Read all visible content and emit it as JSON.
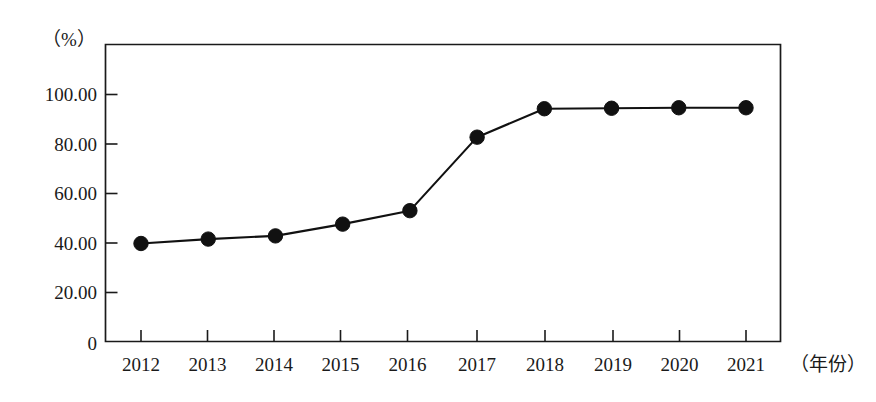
{
  "chart_data": {
    "type": "line",
    "title": "",
    "subtitle": "",
    "xlabel": "（年份）",
    "ylabel": "（%）",
    "categories": [
      "2012",
      "2013",
      "2014",
      "2015",
      "2016",
      "2017",
      "2018",
      "2019",
      "2020",
      "2021"
    ],
    "x": [
      2012,
      2013,
      2014,
      2015,
      2016,
      2017,
      2018,
      2019,
      2020,
      2021
    ],
    "values": [
      39.8,
      41.6,
      42.9,
      47.7,
      53.2,
      83.2,
      94.8,
      95.0,
      95.2,
      95.2
    ],
    "series": [
      {
        "name": "",
        "values": [
          39.8,
          41.6,
          42.9,
          47.7,
          53.2,
          83.2,
          94.8,
          95.0,
          95.2,
          95.2
        ]
      }
    ],
    "ylim": [
      0,
      120
    ],
    "xlim": [
      2011.45,
      2021.55
    ],
    "ytick_labels": [
      "0",
      "20.00",
      "40.00",
      "60.00",
      "80.00",
      "100.00"
    ],
    "ytick_values": [
      0,
      20,
      40,
      60,
      80,
      100
    ],
    "xtick_labels": [
      "2012",
      "2013",
      "2014",
      "2015",
      "2016",
      "2017",
      "2018",
      "2019",
      "2020",
      "2021"
    ],
    "grid": false,
    "legend": false,
    "legend_position": "none",
    "marker": "filled-circle",
    "line_color": "#111111",
    "marker_color": "#111111",
    "axis_color": "#1a1a1a",
    "background_color": "#ffffff",
    "annotations": []
  },
  "axes": {
    "y_axis_title": "（%）",
    "x_axis_title": "（年份）"
  }
}
